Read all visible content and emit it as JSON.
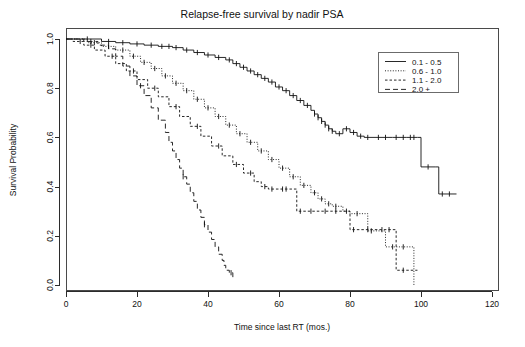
{
  "chart_data": {
    "type": "line",
    "title": "Relapse-free survival by nadir PSA",
    "xlabel": "Time since last RT (mos.)",
    "ylabel": "Survival Probability",
    "xlim": [
      0,
      122
    ],
    "ylim": [
      0.0,
      1.0
    ],
    "xticks": [
      0,
      20,
      40,
      60,
      80,
      100,
      120
    ],
    "xtick_labels": [
      "0",
      "20",
      "40",
      "60",
      "80",
      "100",
      "120"
    ],
    "yticks": [
      0.0,
      0.2,
      0.4,
      0.6,
      0.8,
      1.0
    ],
    "ytick_labels": [
      "0.0",
      "0.2",
      "0.4",
      "0.6",
      "0.8",
      "1.0"
    ],
    "grid": false,
    "legend_position": "top-right",
    "series": [
      {
        "name": "0.1 - 0.5",
        "linestyle": "solid",
        "color": "#111111",
        "points": [
          [
            0,
            1.0
          ],
          [
            4,
            1.0
          ],
          [
            10,
            0.99
          ],
          [
            14,
            0.985
          ],
          [
            18,
            0.98
          ],
          [
            22,
            0.975
          ],
          [
            26,
            0.97
          ],
          [
            30,
            0.965
          ],
          [
            33,
            0.955
          ],
          [
            36,
            0.945
          ],
          [
            39,
            0.935
          ],
          [
            42,
            0.925
          ],
          [
            45,
            0.915
          ],
          [
            47,
            0.9
          ],
          [
            49,
            0.885
          ],
          [
            51,
            0.87
          ],
          [
            53,
            0.855
          ],
          [
            55,
            0.84
          ],
          [
            57,
            0.825
          ],
          [
            59,
            0.805
          ],
          [
            61,
            0.79
          ],
          [
            63,
            0.77
          ],
          [
            65,
            0.75
          ],
          [
            67,
            0.73
          ],
          [
            69,
            0.71
          ],
          [
            70,
            0.695
          ],
          [
            71,
            0.68
          ],
          [
            72,
            0.665
          ],
          [
            73,
            0.65
          ],
          [
            74,
            0.635
          ],
          [
            75,
            0.625
          ],
          [
            76,
            0.615
          ],
          [
            78,
            0.635
          ],
          [
            80,
            0.62
          ],
          [
            82,
            0.605
          ],
          [
            84,
            0.6
          ],
          [
            92,
            0.6
          ],
          [
            96,
            0.6
          ],
          [
            99,
            0.6
          ],
          [
            100,
            0.48
          ],
          [
            104,
            0.48
          ],
          [
            105,
            0.37
          ],
          [
            110,
            0.37
          ]
        ],
        "censor_times": [
          6,
          12,
          16,
          20,
          24,
          27,
          29,
          31,
          34,
          37,
          40,
          43,
          46,
          48,
          50,
          52,
          54,
          56,
          58,
          60,
          62,
          64,
          66,
          68,
          70,
          71,
          72,
          73,
          74,
          75,
          77,
          79,
          81,
          83,
          85,
          88,
          90,
          93,
          95,
          97,
          98,
          102,
          106,
          108
        ]
      },
      {
        "name": "0.6 - 1.0",
        "linestyle": "dotted",
        "color": "#111111",
        "points": [
          [
            0,
            1.0
          ],
          [
            3,
            1.0
          ],
          [
            6,
            0.985
          ],
          [
            10,
            0.97
          ],
          [
            14,
            0.955
          ],
          [
            18,
            0.93
          ],
          [
            21,
            0.905
          ],
          [
            24,
            0.88
          ],
          [
            27,
            0.85
          ],
          [
            30,
            0.82
          ],
          [
            33,
            0.79
          ],
          [
            36,
            0.755
          ],
          [
            39,
            0.72
          ],
          [
            42,
            0.685
          ],
          [
            45,
            0.65
          ],
          [
            48,
            0.615
          ],
          [
            51,
            0.58
          ],
          [
            54,
            0.545
          ],
          [
            57,
            0.51
          ],
          [
            60,
            0.475
          ],
          [
            63,
            0.44
          ],
          [
            66,
            0.405
          ],
          [
            69,
            0.375
          ],
          [
            71,
            0.35
          ],
          [
            73,
            0.33
          ],
          [
            75,
            0.32
          ],
          [
            78,
            0.3
          ],
          [
            80,
            0.29
          ],
          [
            83,
            0.29
          ],
          [
            85,
            0.22
          ],
          [
            88,
            0.22
          ],
          [
            90,
            0.155
          ],
          [
            98,
            0.155
          ],
          [
            98,
            0.0
          ]
        ],
        "censor_times": [
          8,
          12,
          16,
          19,
          22,
          25,
          28,
          31,
          34,
          37,
          40,
          43,
          46,
          49,
          52,
          55,
          58,
          61,
          64,
          67,
          70,
          72,
          74,
          76,
          79,
          82,
          86,
          92,
          95
        ]
      },
      {
        "name": "1.1 - 2.0",
        "linestyle": "dashed-short",
        "color": "#111111",
        "points": [
          [
            0,
            1.0
          ],
          [
            2,
            0.99
          ],
          [
            5,
            0.975
          ],
          [
            8,
            0.955
          ],
          [
            11,
            0.93
          ],
          [
            14,
            0.9
          ],
          [
            17,
            0.87
          ],
          [
            20,
            0.835
          ],
          [
            23,
            0.8
          ],
          [
            26,
            0.765
          ],
          [
            29,
            0.725
          ],
          [
            32,
            0.685
          ],
          [
            35,
            0.645
          ],
          [
            38,
            0.605
          ],
          [
            41,
            0.565
          ],
          [
            44,
            0.525
          ],
          [
            47,
            0.49
          ],
          [
            50,
            0.455
          ],
          [
            53,
            0.42
          ],
          [
            55,
            0.4
          ],
          [
            57,
            0.39
          ],
          [
            60,
            0.39
          ],
          [
            63,
            0.39
          ],
          [
            65,
            0.3
          ],
          [
            68,
            0.3
          ],
          [
            72,
            0.3
          ],
          [
            75,
            0.3
          ],
          [
            78,
            0.3
          ],
          [
            80,
            0.225
          ],
          [
            84,
            0.225
          ],
          [
            88,
            0.225
          ],
          [
            92,
            0.225
          ],
          [
            93,
            0.06
          ],
          [
            97,
            0.06
          ],
          [
            99,
            0.06
          ]
        ],
        "censor_times": [
          4,
          7,
          13,
          19,
          25,
          31,
          37,
          43,
          48,
          52,
          56,
          58,
          61,
          62,
          66,
          69,
          73,
          76,
          81,
          85,
          89,
          91,
          95
        ]
      },
      {
        "name": "2.0 +",
        "linestyle": "dashed-long",
        "color": "#111111",
        "points": [
          [
            0,
            1.0
          ],
          [
            5,
            0.99
          ],
          [
            9,
            0.975
          ],
          [
            12,
            0.96
          ],
          [
            14,
            0.93
          ],
          [
            16,
            0.89
          ],
          [
            18,
            0.85
          ],
          [
            20,
            0.81
          ],
          [
            22,
            0.77
          ],
          [
            24,
            0.72
          ],
          [
            26,
            0.67
          ],
          [
            28,
            0.62
          ],
          [
            29,
            0.58
          ],
          [
            30,
            0.545
          ],
          [
            31,
            0.51
          ],
          [
            32,
            0.475
          ],
          [
            33,
            0.44
          ],
          [
            34,
            0.41
          ],
          [
            35,
            0.375
          ],
          [
            36,
            0.34
          ],
          [
            37,
            0.305
          ],
          [
            38,
            0.275
          ],
          [
            39,
            0.245
          ],
          [
            40,
            0.215
          ],
          [
            41,
            0.185
          ],
          [
            42,
            0.155
          ],
          [
            43,
            0.125
          ],
          [
            44,
            0.1
          ],
          [
            44.5,
            0.08
          ],
          [
            45,
            0.06
          ],
          [
            46,
            0.05
          ],
          [
            47,
            0.02
          ]
        ],
        "censor_times": [
          7,
          21,
          33,
          39,
          46.5
        ]
      }
    ]
  },
  "legend": {
    "entries": [
      {
        "label": "0.1 - 0.5",
        "style": "solid"
      },
      {
        "label": "0.6 - 1.0",
        "style": "dotted"
      },
      {
        "label": "1.1 - 2.0",
        "style": "dashed-short"
      },
      {
        "label": "2.0 +",
        "style": "dashed-long"
      }
    ]
  }
}
